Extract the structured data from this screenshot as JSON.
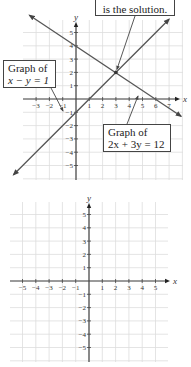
{
  "chart_data": [
    {
      "type": "line",
      "title": "",
      "xlabel": "x",
      "ylabel": "y",
      "xlim": [
        -4,
        8
      ],
      "ylim": [
        -6,
        6
      ],
      "x_ticks": [
        -3,
        -2,
        -1,
        1,
        2,
        3,
        4,
        5,
        6,
        7
      ],
      "y_ticks": [
        5,
        4,
        3,
        2,
        1,
        -1,
        -2,
        -3,
        -4,
        -5
      ],
      "grid": true,
      "series": [
        {
          "name": "x − y = 1",
          "points": [
            [
              -4.7,
              -5.7
            ],
            [
              7,
              6
            ]
          ]
        },
        {
          "name": "2x + 3y = 12",
          "points": [
            [
              -3.5,
              6.3
            ],
            [
              7.9,
              -1.3
            ]
          ]
        }
      ],
      "annotations": [
        {
          "text": "is the solution.",
          "point": [
            3,
            2
          ]
        },
        {
          "text_line1": "Graph of",
          "text_line2": "x − y = 1"
        },
        {
          "text_line1": "Graph of",
          "text_line2": "2x + 3y = 12"
        }
      ],
      "intersection": [
        3,
        2
      ]
    },
    {
      "type": "line",
      "title": "",
      "xlabel": "x",
      "ylabel": "y",
      "xlim": [
        -6,
        6
      ],
      "ylim": [
        -6,
        6
      ],
      "x_ticks": [
        -5,
        -4,
        -3,
        -2,
        -1,
        1,
        2,
        3,
        4,
        5
      ],
      "y_ticks": [
        5,
        4,
        3,
        2,
        1,
        -1,
        -2,
        -3,
        -4,
        -5
      ],
      "grid": true,
      "series": []
    }
  ],
  "top": {
    "callout_solution": "is the solution.",
    "callout_line1_label": "Graph of",
    "callout_line1_eq": "x − y = 1",
    "callout_line2_label": "Graph of",
    "callout_line2_eq": "2x + 3y = 12",
    "x_axis_label": "x",
    "y_axis_label": "y",
    "x_ticks": [
      "−3",
      "−2",
      "−1",
      "1",
      "2",
      "3",
      "4",
      "5",
      "6",
      "7"
    ],
    "y_ticks": [
      "5",
      "4",
      "3",
      "2",
      "1",
      "−1",
      "−2",
      "−3",
      "−4",
      "−5"
    ]
  },
  "bottom": {
    "x_axis_label": "x",
    "y_axis_label": "y",
    "x_ticks": [
      "−5",
      "−4",
      "−3",
      "−2",
      "−1",
      "1",
      "2",
      "3",
      "4",
      "5"
    ],
    "y_ticks": [
      "5",
      "4",
      "3",
      "2",
      "1",
      "−1",
      "−2",
      "−3",
      "−4",
      "−5"
    ]
  },
  "colors": {
    "line": "#555555",
    "grid": "#dddddd",
    "axis": "#444444"
  }
}
